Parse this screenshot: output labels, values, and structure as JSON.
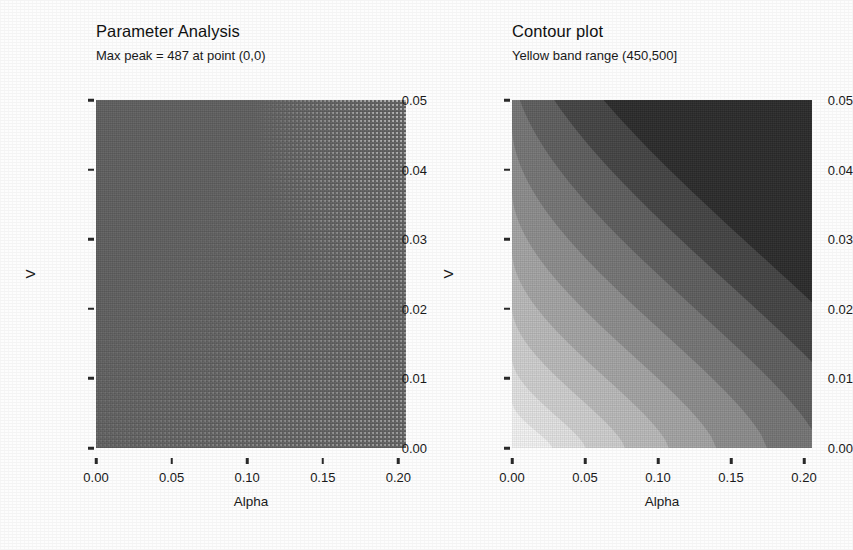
{
  "figure": {
    "background_color": "#fdfdfd",
    "text_color": "#1a1a1a",
    "width": 853,
    "height": 550
  },
  "panels": [
    {
      "id": "parameter-analysis",
      "title": "Parameter Analysis",
      "subtitle": "Max peak = 487 at point (0,0)"
    },
    {
      "id": "contour-plot",
      "title": "Contour plot",
      "subtitle": "Yellow band range (450,500]"
    }
  ],
  "axes": {
    "xlabel": "Alpha",
    "ylabel": "V",
    "xticks": [
      "0.00",
      "0.05",
      "0.10",
      "0.15",
      "0.20"
    ],
    "yticks": [
      "0.00",
      "0.01",
      "0.02",
      "0.03",
      "0.04",
      "0.05"
    ],
    "xlim": [
      0.0,
      0.205
    ],
    "ylim": [
      0.0,
      0.0515
    ]
  },
  "chart_data": [
    {
      "type": "heatmap",
      "title": "Parameter Analysis",
      "subtitle": "Max peak = 487 at point (0,0)",
      "xlabel": "Alpha",
      "ylabel": "V",
      "xlim": [
        0.0,
        0.205
      ],
      "ylim": [
        0.0,
        0.0515
      ],
      "xticks": [
        0.0,
        0.05,
        0.1,
        0.15,
        0.2
      ],
      "yticks": [
        0.0,
        0.01,
        0.02,
        0.03,
        0.04,
        0.05
      ],
      "grid": false,
      "legend": "none",
      "max_peak_value": 487,
      "max_peak_point": [
        0,
        0
      ],
      "fill_color": "#606060",
      "description": "Dense uniform raster of sampled parameter points covering the whole Alpha-V domain; sampling dots become visually resolvable toward the upper-right region.",
      "annotations": [
        "Max peak = 487 at point (0,0)"
      ]
    },
    {
      "type": "heatmap",
      "title": "Contour plot",
      "subtitle": "Yellow band range (450,500]",
      "xlabel": "Alpha",
      "ylabel": "V",
      "xlim": [
        0.0,
        0.205
      ],
      "ylim": [
        0.0,
        0.0515
      ],
      "xticks": [
        0.0,
        0.05,
        0.1,
        0.15,
        0.2
      ],
      "yticks": [
        0.0,
        0.01,
        0.02,
        0.03,
        0.04,
        0.05
      ],
      "grid": false,
      "legend": "none",
      "highlight_band": "(450,500]",
      "annotations": [
        "Yellow band range (450,500]"
      ],
      "description": "Filled contour bands of a decaying response surface; values are highest (lightest) near the bottom-left origin and fall off along hyperbolic contours toward the upper-right, where the surface is lowest (darkest).",
      "band_levels": [
        500,
        450,
        400,
        350,
        300,
        250,
        200,
        150,
        100,
        50
      ],
      "band_colors": [
        "#f4f4f4",
        "#e2e2e2",
        "#cfcfcf",
        "#bababa",
        "#a4a4a4",
        "#8d8d8d",
        "#767676",
        "#5e5e5e",
        "#444444",
        "#2b2b2b"
      ]
    }
  ]
}
